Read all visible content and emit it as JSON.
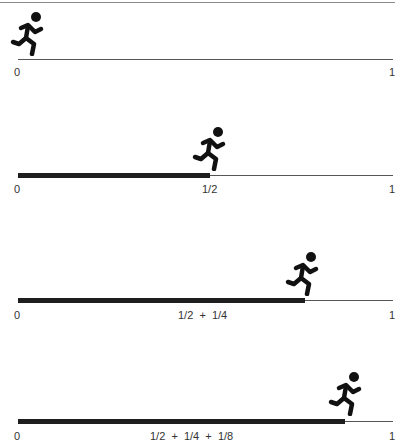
{
  "diagram": {
    "title": "",
    "colors": {
      "track": "#555555",
      "progress": "#1e1e1e",
      "runner": "#111111"
    },
    "panels": [
      {
        "line_y": 59,
        "progress_end_x": 18,
        "runner_x": 10,
        "labels": {
          "start": "0",
          "end": "1",
          "middle": ""
        }
      },
      {
        "line_y": 175,
        "progress_end_x": 210,
        "runner_x": 193,
        "labels": {
          "start": "0",
          "end": "1",
          "middle": "1/2"
        }
      },
      {
        "line_y": 300,
        "progress_end_x": 305,
        "runner_x": 287,
        "labels": {
          "start": "0",
          "end": "1",
          "middle": "1/2  +  1/4"
        }
      },
      {
        "line_y": 421,
        "progress_end_x": 345,
        "runner_x": 328,
        "labels": {
          "start": "0",
          "end": "1",
          "middle": "1/2  +  1/4  +  1/8"
        }
      }
    ]
  }
}
